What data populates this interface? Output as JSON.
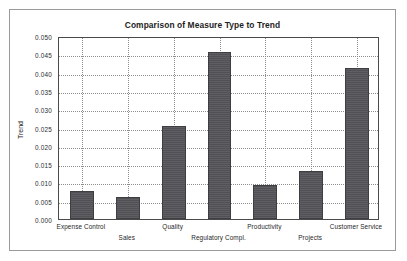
{
  "figure": {
    "title": "Comparison of Measure Type to Trend",
    "y_axis_title": "Trend",
    "frame_color": "#9a9a9a",
    "axis_color": "#4a4a4a",
    "grid_color": "#8d8d8d",
    "bar_color": "#55555a",
    "background": "#ffffff"
  },
  "chart_data": {
    "type": "bar",
    "title": "Comparison of Measure Type to Trend",
    "xlabel": "",
    "ylabel": "Trend",
    "ylim": [
      0.0,
      0.05
    ],
    "yticks": [
      0.0,
      0.005,
      0.01,
      0.015,
      0.02,
      0.025,
      0.03,
      0.035,
      0.04,
      0.045,
      0.05
    ],
    "ytick_labels": [
      "0.000",
      "0.005",
      "0.010",
      "0.015",
      "0.020",
      "0.025",
      "0.030",
      "0.035",
      "0.040",
      "0.045",
      "0.050"
    ],
    "grid": "both-axes-dotted",
    "legend": "none",
    "categories": [
      "Expense Control",
      "Sales",
      "Quality",
      "Regulatory Compl.",
      "Productivity",
      "Projects",
      "Customer Service"
    ],
    "values": [
      0.0076,
      0.006,
      0.0255,
      0.0457,
      0.0094,
      0.013,
      0.0412
    ]
  }
}
